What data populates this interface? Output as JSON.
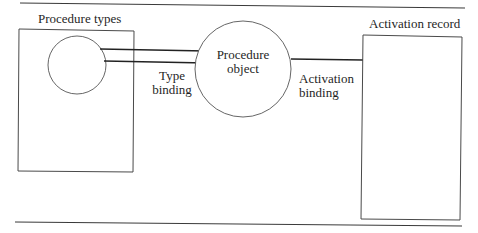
{
  "diagram": {
    "title_labels": {
      "procedure_types": "Procedure types",
      "activation_record": "Activation record"
    },
    "nodes": {
      "procedure_object_line1": "Procedure",
      "procedure_object_line2": "object"
    },
    "edges": {
      "type_binding_line1": "Type",
      "type_binding_line2": "binding",
      "activation_binding_line1": "Activation",
      "activation_binding_line2": "binding"
    },
    "colors": {
      "stroke": "#2a2a2a",
      "rule": "#3a3a3a",
      "background": "#ffffff"
    }
  }
}
